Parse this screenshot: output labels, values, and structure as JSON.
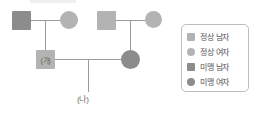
{
  "diagram": {
    "type": "pedigree-chart",
    "topic": "미맹 가계도",
    "generations": [
      {
        "id": "generation-1",
        "couples": [
          {
            "id": "couple-left",
            "father": {
              "symbol": "square",
              "status": "미맹 남자",
              "fill": "dark",
              "label": ""
            },
            "mother": {
              "symbol": "circle",
              "status": "정상 여자",
              "fill": "light",
              "label": ""
            }
          },
          {
            "id": "couple-right",
            "father": {
              "symbol": "square",
              "status": "정상 남자",
              "fill": "light",
              "label": ""
            },
            "mother": {
              "symbol": "circle",
              "status": "정상 여자",
              "fill": "light",
              "label": ""
            }
          }
        ]
      },
      {
        "id": "generation-2",
        "couples": [
          {
            "id": "couple-middle",
            "father": {
              "symbol": "square",
              "status": "정상 남자",
              "fill": "light",
              "label": "(가)"
            },
            "mother": {
              "symbol": "circle",
              "status": "미맹 여자",
              "fill": "dark",
              "label": ""
            }
          }
        ]
      },
      {
        "id": "generation-3",
        "children": [
          {
            "id": "child-na",
            "symbol": "none",
            "label": "(나)"
          }
        ]
      }
    ],
    "labels": {
      "person_ga": "(가)",
      "person_na": "(나)"
    }
  },
  "legend": {
    "items": [
      {
        "swatch": "square",
        "fill": "light",
        "color": "#b3b3b3",
        "label": "정상 남자"
      },
      {
        "swatch": "circle",
        "fill": "light",
        "color": "#b3b3b3",
        "label": "정상 여자"
      },
      {
        "swatch": "square",
        "fill": "dark",
        "color": "#8c8c8c",
        "label": "미맹 남자"
      },
      {
        "swatch": "circle",
        "fill": "dark",
        "color": "#8c8c8c",
        "label": "미맹 여자"
      }
    ]
  },
  "colors": {
    "normal": "#b3b3b3",
    "affected": "#8c8c8c",
    "line": "#9a9a9a",
    "legend_border": "#bdbdbd",
    "text": "#555555",
    "background": "#ffffff"
  }
}
